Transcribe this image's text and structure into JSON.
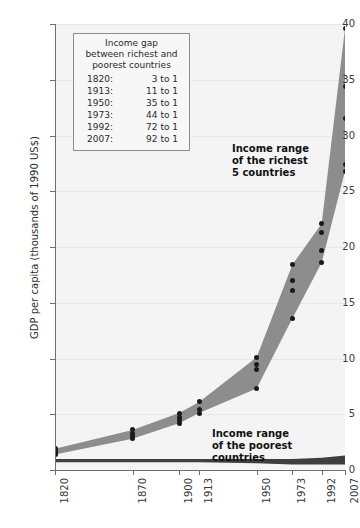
{
  "chart_data": {
    "type": "area",
    "title": "",
    "xlabel": "",
    "ylabel": "GDP per capita (thousands of 1990 US$)",
    "ylim": [
      0,
      40
    ],
    "grid": true,
    "legend_position": "inside-upper-left",
    "categories": [
      "1820",
      "1870",
      "1900",
      "1913",
      "1950",
      "1973",
      "1992",
      "2007"
    ],
    "y_ticks": [
      "0",
      "5",
      "10",
      "15",
      "20",
      "25",
      "30",
      "35",
      "40"
    ],
    "series": [
      {
        "name": "Income range of the richest 5 countries",
        "upper": [
          1.9,
          3.6,
          5.1,
          6.1,
          10.1,
          18.4,
          22.1,
          39.6
        ],
        "lower": [
          1.4,
          2.8,
          4.2,
          5.1,
          7.3,
          13.6,
          18.6,
          26.8
        ]
      },
      {
        "name": "Income range of the poorest countries",
        "upper": [
          1.0,
          1.0,
          1.0,
          1.0,
          1.0,
          1.0,
          1.1,
          1.3
        ],
        "lower": [
          0.7,
          0.7,
          0.7,
          0.7,
          0.6,
          0.5,
          0.5,
          0.5
        ]
      }
    ],
    "points": {
      "1820": [
        1.9,
        1.7,
        1.5,
        1.4
      ],
      "1870": [
        3.6,
        3.3,
        3.1,
        2.8
      ],
      "1900": [
        5.1,
        4.7,
        4.4,
        4.2
      ],
      "1913": [
        6.1,
        5.4,
        5.1
      ],
      "1950": [
        10.1,
        9.5,
        9.0,
        7.3
      ],
      "1973": [
        18.4,
        17.0,
        16.1,
        13.6
      ],
      "1992": [
        22.1,
        21.3,
        19.7,
        18.6
      ],
      "2007": [
        39.6,
        34.4,
        31.5,
        27.4,
        26.8
      ]
    },
    "annotations": [
      {
        "name": "rich-range-annotation",
        "text": "Income range\nof the richest\n5 countries"
      },
      {
        "name": "poor-range-annotation",
        "text": "Income range\nof the poorest\ncountries"
      }
    ],
    "colors": {
      "band_fill": "#8d8d8d",
      "poor_band_fill": "#3f3f3f",
      "dot": "#1a1a1a",
      "plot_background": "#f4f4f4",
      "axis": "#6e6e6e",
      "gridline": "#e7e7e7",
      "text": "#2b2b2b"
    }
  },
  "annotations": {
    "rich_line1": "Income range",
    "rich_line2": "of the richest",
    "rich_line3": "5 countries",
    "poor_line1": "Income range",
    "poor_line2": "of the poorest",
    "poor_line3": "countries"
  },
  "axis": {
    "y_title": "GDP per capita (thousands of 1990 US$)"
  },
  "legend": {
    "title_line1": "Income gap",
    "title_line2": "between richest and",
    "title_line3": "poorest countries",
    "rows": [
      {
        "year": "1820:",
        "ratio": "3 to 1"
      },
      {
        "year": "1913:",
        "ratio": "11 to 1"
      },
      {
        "year": "1950:",
        "ratio": "35 to 1"
      },
      {
        "year": "1973:",
        "ratio": "44 to 1"
      },
      {
        "year": "1992:",
        "ratio": "72 to 1"
      },
      {
        "year": "2007:",
        "ratio": "92 to 1"
      }
    ]
  }
}
